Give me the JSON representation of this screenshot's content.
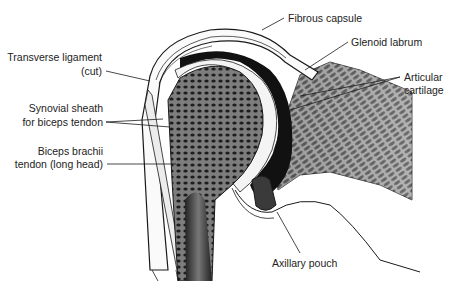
{
  "figure": {
    "labels": {
      "fibrous_capsule": "Fibrous capsule",
      "glenoid_labrum": "Glenoid labrum",
      "articular_cartilage_1": "Articular",
      "articular_cartilage_2": "cartilage",
      "transverse_ligament_1": "Transverse ligament",
      "transverse_ligament_2": "(cut)",
      "synovial_sheath_1": "Synovial sheath",
      "synovial_sheath_2": "for biceps tendon",
      "biceps_tendon_1": "Biceps brachii",
      "biceps_tendon_2": "tendon (long head)",
      "axillary_pouch": "Axillary pouch"
    },
    "colors": {
      "ink": "#1a1a1a",
      "bone_shade": "#8a8a8a",
      "glenoid_shade": "#9c9c9c",
      "cartilage": "#f4f4f4"
    }
  }
}
